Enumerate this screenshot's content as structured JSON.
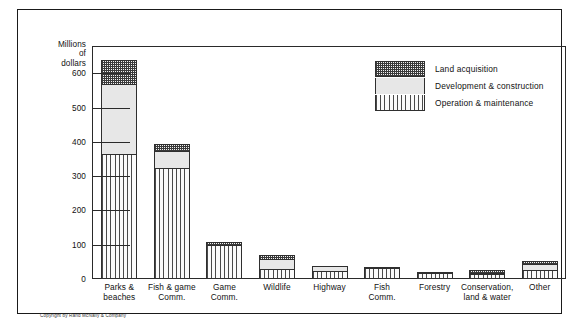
{
  "chart_data": {
    "type": "bar",
    "subtype": "stacked-vertical",
    "title": "",
    "xlabel": "",
    "ylabel": "Millions of dollars",
    "ylabel_lines": [
      "Millions",
      "of",
      "dollars"
    ],
    "ylim": [
      0,
      680
    ],
    "yticks": [
      0,
      100,
      200,
      300,
      400,
      500,
      600
    ],
    "ytick_labels": [
      "0",
      "100",
      "200",
      "300",
      "400",
      "500",
      "600"
    ],
    "grid": false,
    "legend_position": "upper-right-inside",
    "categories": [
      "Parks & beaches",
      "Fish & game Comm.",
      "Game Comm.",
      "Wildlife",
      "Highway",
      "Fish Comm.",
      "Forestry",
      "Conservation, land & water",
      "Other"
    ],
    "category_label_lines": [
      [
        "Parks &",
        "beaches"
      ],
      [
        "Fish & game",
        "Comm."
      ],
      [
        "Game",
        "Comm."
      ],
      [
        "Wildlife"
      ],
      [
        "Highway"
      ],
      [
        "Fish",
        "Comm."
      ],
      [
        "Forestry"
      ],
      [
        "Conservation,",
        "land & water"
      ],
      [
        "Other"
      ]
    ],
    "series": [
      {
        "name": "Operation & maintenance",
        "pattern": "vertical-stripes",
        "values": [
          365,
          325,
          100,
          28,
          22,
          33,
          17,
          15,
          26
        ]
      },
      {
        "name": "Development & construction",
        "pattern": "solid-light-gray",
        "values": [
          205,
          50,
          0,
          30,
          16,
          2,
          1,
          3,
          18
        ]
      },
      {
        "name": "Land acquisition",
        "pattern": "checkerboard",
        "values": [
          70,
          20,
          8,
          12,
          0,
          0,
          0,
          7,
          8
        ]
      }
    ],
    "totals": [
      640,
      395,
      108,
      70,
      38,
      35,
      18,
      25,
      52
    ]
  },
  "legend": {
    "items": [
      {
        "label": "Land acquisition",
        "swatch": "checkerboard"
      },
      {
        "label": "Development & construction",
        "swatch": "solid-light-gray"
      },
      {
        "label": "Operation & maintenance",
        "swatch": "vertical-stripes"
      }
    ]
  },
  "footer": {
    "copyright": "Copyright by Rand McNally & Company"
  },
  "colors": {
    "ink": "#1a1a1a",
    "axis": "#2a2a2a",
    "outline": "#2f2f2f",
    "land_acquisition": "#8a8a8a",
    "development": "#e7e7e7",
    "operation": "#4a4a4a",
    "background": "#ffffff"
  }
}
